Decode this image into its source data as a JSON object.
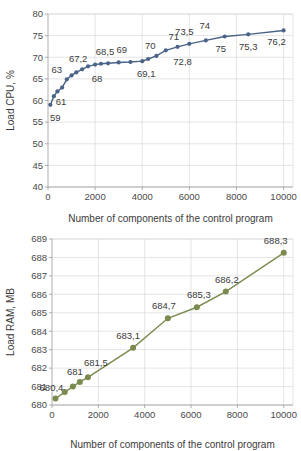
{
  "chart_data": [
    {
      "id": "cpu",
      "type": "line",
      "title": "",
      "xlabel": "Number of components of the control program",
      "ylabel": "Load CPU, %",
      "xlim": [
        0,
        10400
      ],
      "ylim": [
        40,
        80
      ],
      "xticks": [
        0,
        2000,
        4000,
        6000,
        8000,
        10000
      ],
      "xticklabels": [
        "0",
        "2000",
        "4000",
        "6000",
        "8000",
        "10000"
      ],
      "yticks": [
        40,
        45,
        50,
        55,
        60,
        65,
        70,
        75,
        80
      ],
      "yticklabels": [
        "40",
        "45",
        "50",
        "55",
        "60",
        "65",
        "70",
        "75",
        "80"
      ],
      "grid": true,
      "series_color": "#4a6387",
      "marker_color": "#4a6387",
      "series": [
        {
          "name": "Load CPU",
          "x": [
            100,
            250,
            400,
            600,
            800,
            1000,
            1200,
            1450,
            1700,
            2000,
            2250,
            2550,
            3000,
            3500,
            4000,
            4250,
            4600,
            5000,
            5500,
            6000,
            6700,
            7500,
            8500,
            10000
          ],
          "y": [
            59,
            61,
            62.1,
            63,
            64.9,
            65.8,
            66.5,
            67.2,
            67.9,
            68.3,
            68.5,
            68.6,
            68.8,
            68.9,
            69.1,
            69.6,
            70.3,
            71.6,
            72.4,
            73.1,
            73.9,
            74.8,
            75.3,
            76.2
          ]
        }
      ],
      "point_labels": [
        {
          "text": "59",
          "x": 100,
          "y": 59,
          "dx": 5,
          "dy": 16
        },
        {
          "text": "61",
          "x": 600,
          "y": 63,
          "dx": -1,
          "dy": 17
        },
        {
          "text": "63",
          "x": 800,
          "y": 64.9,
          "dx": -10,
          "dy": -6
        },
        {
          "text": "67,2",
          "x": 1450,
          "y": 67.2,
          "dx": -4,
          "dy": -7
        },
        {
          "text": "68",
          "x": 2000,
          "y": 68.3,
          "dx": 2,
          "dy": 17
        },
        {
          "text": "68,5",
          "x": 2250,
          "y": 68.5,
          "dx": 4,
          "dy": -9
        },
        {
          "text": "69",
          "x": 3000,
          "y": 68.8,
          "dx": 3,
          "dy": -9
        },
        {
          "text": "69,1",
          "x": 4000,
          "y": 69.1,
          "dx": 4,
          "dy": 16
        },
        {
          "text": "70",
          "x": 4600,
          "y": 70.3,
          "dx": -6,
          "dy": -7
        },
        {
          "text": "71",
          "x": 5000,
          "y": 71.6,
          "dx": 8,
          "dy": -10
        },
        {
          "text": "72,8",
          "x": 5500,
          "y": 72.4,
          "dx": 5,
          "dy": 18
        },
        {
          "text": "73,5",
          "x": 6000,
          "y": 73.1,
          "dx": -5,
          "dy": -9
        },
        {
          "text": "74",
          "x": 6700,
          "y": 73.9,
          "dx": -1,
          "dy": -11
        },
        {
          "text": "75",
          "x": 7500,
          "y": 74.8,
          "dx": -4,
          "dy": 16
        },
        {
          "text": "75,3",
          "x": 8500,
          "y": 75.3,
          "dx": 0,
          "dy": 16
        },
        {
          "text": "76,2",
          "x": 10000,
          "y": 76.2,
          "dx": -7,
          "dy": 15
        }
      ]
    },
    {
      "id": "ram",
      "type": "line",
      "title": "",
      "xlabel": "Number of components of the control program",
      "ylabel": "Load RAM, MB",
      "xlim": [
        0,
        10400
      ],
      "ylim": [
        680,
        689
      ],
      "xticks": [
        0,
        2000,
        4000,
        6000,
        8000,
        10000
      ],
      "xticklabels": [
        "0",
        "2000",
        "4000",
        "6000",
        "8000",
        "10000"
      ],
      "yticks": [
        680,
        681,
        682,
        683,
        684,
        685,
        686,
        687,
        688,
        689
      ],
      "yticklabels": [
        "680",
        "681",
        "682",
        "683",
        "684",
        "685",
        "686",
        "687",
        "688",
        "689"
      ],
      "grid": true,
      "series_color": "#7b8b4f",
      "marker_color": "#7b8b4f",
      "series": [
        {
          "name": "Load RAM",
          "x": [
            150,
            550,
            900,
            1200,
            1550,
            3500,
            5000,
            6250,
            7500,
            10000
          ],
          "y": [
            680.35,
            680.7,
            681.0,
            681.25,
            681.5,
            683.1,
            684.7,
            685.3,
            686.15,
            688.25
          ]
        }
      ],
      "point_labels": [
        {
          "text": "680,4",
          "x": 150,
          "y": 680.35,
          "dx": -4,
          "dy": -8
        },
        {
          "text": "681",
          "x": 900,
          "y": 681.0,
          "dx": 2,
          "dy": -12
        },
        {
          "text": "681,5",
          "x": 1550,
          "y": 681.5,
          "dx": 8,
          "dy": -11
        },
        {
          "text": "683,1",
          "x": 3500,
          "y": 683.1,
          "dx": -5,
          "dy": -9
        },
        {
          "text": "684,7",
          "x": 5000,
          "y": 684.7,
          "dx": -4,
          "dy": -9
        },
        {
          "text": "685,3",
          "x": 6250,
          "y": 685.3,
          "dx": 2,
          "dy": -9
        },
        {
          "text": "686,2",
          "x": 7500,
          "y": 686.15,
          "dx": 1,
          "dy": -9
        },
        {
          "text": "688,3",
          "x": 10000,
          "y": 688.25,
          "dx": -8,
          "dy": -9
        }
      ]
    }
  ]
}
